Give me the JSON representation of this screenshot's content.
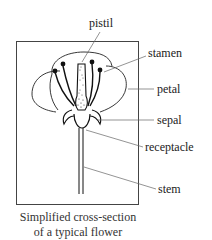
{
  "diagram": {
    "labels": {
      "pistil": "pistil",
      "stamen": "stamen",
      "petal": "petal",
      "sepal": "sepal",
      "receptacle": "receptacle",
      "stem": "stem"
    },
    "caption": {
      "line1": "Simplified cross-section",
      "line2": "of a typical flower"
    },
    "colors": {
      "ink": "#111111",
      "leader": "#555555",
      "frame": "#444444",
      "background": "#ffffff"
    }
  }
}
